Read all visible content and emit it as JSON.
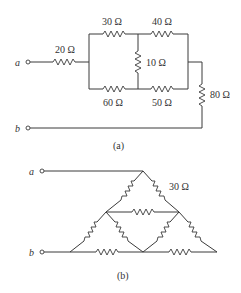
{
  "figure_a": {
    "caption": "(a)",
    "terminal_a": "a",
    "terminal_b": "b",
    "resistors": {
      "r20": "20 Ω",
      "r30": "30 Ω",
      "r40": "40 Ω",
      "r10": "10 Ω",
      "r60": "60 Ω",
      "r50": "50 Ω",
      "r80": "80 Ω"
    }
  },
  "figure_b": {
    "caption": "(b)",
    "terminal_a": "a",
    "terminal_b": "b",
    "resistor_label": "30 Ω",
    "resistor_count": 9
  }
}
